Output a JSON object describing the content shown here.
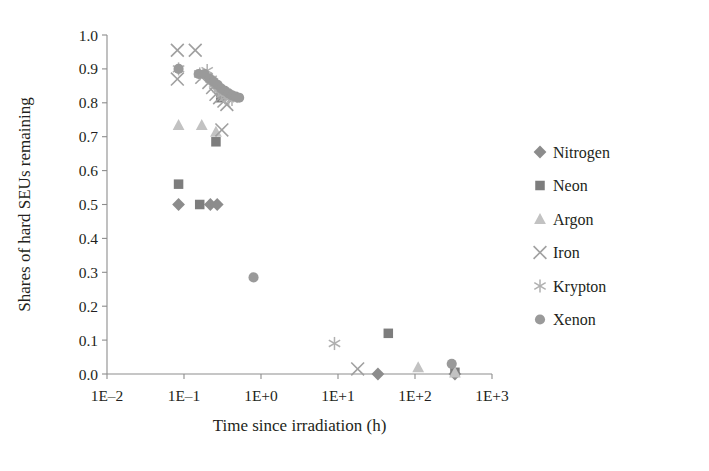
{
  "chart_data": {
    "type": "scatter",
    "title": "",
    "xlabel": "Time since irradiation (h)",
    "ylabel": "Shares of hard SEUs remaining",
    "xscale": "log",
    "xlim": [
      0.01,
      1000
    ],
    "ylim": [
      0.0,
      1.0
    ],
    "xticks": [
      "1E–2",
      "1E–1",
      "1E+0",
      "1E+1",
      "1E+2",
      "1E+3"
    ],
    "xtick_values": [
      0.01,
      0.1,
      1,
      10,
      100,
      1000
    ],
    "yticks": [
      "0.0",
      "0.1",
      "0.2",
      "0.3",
      "0.4",
      "0.5",
      "0.6",
      "0.7",
      "0.8",
      "0.9",
      "1.0"
    ],
    "ytick_values": [
      0.0,
      0.1,
      0.2,
      0.3,
      0.4,
      0.5,
      0.6,
      0.7,
      0.8,
      0.9,
      1.0
    ],
    "grid": false,
    "legend_position": "right",
    "series": [
      {
        "name": "Nitrogen",
        "marker": "diamond",
        "color": "#8c8c8c",
        "points": [
          [
            0.085,
            0.5
          ],
          [
            0.22,
            0.5
          ],
          [
            0.27,
            0.5
          ],
          [
            33.0,
            0.0
          ],
          [
            330.0,
            0.0
          ]
        ]
      },
      {
        "name": "Neon",
        "marker": "square",
        "color": "#7d7d7d",
        "points": [
          [
            0.085,
            0.56
          ],
          [
            0.16,
            0.5
          ],
          [
            0.26,
            0.685
          ],
          [
            0.3,
            0.815
          ],
          [
            45.0,
            0.12
          ],
          [
            330.0,
            0.005
          ]
        ]
      },
      {
        "name": "Argon",
        "marker": "triangle",
        "color": "#c2c2c2",
        "points": [
          [
            0.085,
            0.735
          ],
          [
            0.17,
            0.735
          ],
          [
            0.26,
            0.715
          ],
          [
            110.0,
            0.02
          ],
          [
            330.0,
            0.005
          ]
        ]
      },
      {
        "name": "Iron",
        "marker": "x",
        "color": "#a0a0a0",
        "points": [
          [
            0.082,
            0.955
          ],
          [
            0.082,
            0.87
          ],
          [
            0.14,
            0.955
          ],
          [
            0.17,
            0.875
          ],
          [
            0.21,
            0.86
          ],
          [
            0.235,
            0.845
          ],
          [
            0.26,
            0.825
          ],
          [
            0.29,
            0.815
          ],
          [
            0.33,
            0.805
          ],
          [
            0.36,
            0.795
          ],
          [
            0.31,
            0.72
          ],
          [
            18.0,
            0.015
          ]
        ]
      },
      {
        "name": "Krypton",
        "marker": "asterisk",
        "color": "#b0b0b0",
        "points": [
          [
            0.085,
            0.9
          ],
          [
            0.16,
            0.885
          ],
          [
            0.2,
            0.895
          ],
          [
            0.225,
            0.87
          ],
          [
            0.25,
            0.855
          ],
          [
            0.28,
            0.84
          ],
          [
            0.31,
            0.825
          ],
          [
            0.34,
            0.815
          ],
          [
            0.38,
            0.812
          ],
          [
            0.42,
            0.81
          ],
          [
            9.0,
            0.09
          ]
        ]
      },
      {
        "name": "Xenon",
        "marker": "circle",
        "color": "#9a9a9a",
        "points": [
          [
            0.085,
            0.9
          ],
          [
            0.155,
            0.885
          ],
          [
            0.185,
            0.885
          ],
          [
            0.215,
            0.872
          ],
          [
            0.245,
            0.862
          ],
          [
            0.275,
            0.852
          ],
          [
            0.305,
            0.842
          ],
          [
            0.34,
            0.835
          ],
          [
            0.38,
            0.828
          ],
          [
            0.42,
            0.822
          ],
          [
            0.47,
            0.818
          ],
          [
            0.52,
            0.815
          ],
          [
            0.8,
            0.285
          ],
          [
            300.0,
            0.03
          ]
        ]
      }
    ]
  },
  "legend": {
    "entries": [
      {
        "label": "Nitrogen",
        "marker": "diamond",
        "color": "#8c8c8c"
      },
      {
        "label": "Neon",
        "marker": "square",
        "color": "#7d7d7d"
      },
      {
        "label": "Argon",
        "marker": "triangle",
        "color": "#c2c2c2"
      },
      {
        "label": "Iron",
        "marker": "x",
        "color": "#a0a0a0"
      },
      {
        "label": "Krypton",
        "marker": "asterisk",
        "color": "#b0b0b0"
      },
      {
        "label": "Xenon",
        "marker": "circle",
        "color": "#9a9a9a"
      }
    ]
  }
}
